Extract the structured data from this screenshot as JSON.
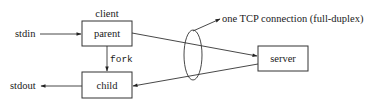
{
  "diagram": {
    "nodes": {
      "client_label": "client",
      "parent": "parent",
      "child": "child",
      "server": "server"
    },
    "io": {
      "stdin": "stdin",
      "stdout": "stdout"
    },
    "edges": {
      "fork_label": "fork"
    },
    "annotation": "one TCP connection (full-duplex)",
    "colors": {
      "stroke": "#333333",
      "text": "#1a1a1a",
      "background": "#ffffff"
    }
  }
}
